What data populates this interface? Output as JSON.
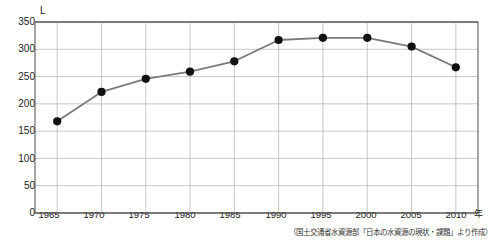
{
  "top_bleed_text": "",
  "axis": {
    "y_unit": "L",
    "x_unit": "年",
    "y_ticks": [
      "0",
      "50",
      "100",
      "150",
      "200",
      "250",
      "300",
      "350"
    ],
    "x_ticks": [
      "1965",
      "1970",
      "1975",
      "1980",
      "1985",
      "1990",
      "1995",
      "2000",
      "2005",
      "2010"
    ]
  },
  "source_note": "（国土交通省水資源部「日本の水資源の現状・課題」より作成）",
  "colors": {
    "line": "#7a7a7a",
    "marker": "#111111",
    "grid": "#b9b9b9",
    "axis": "#555555",
    "background": "#ffffff"
  },
  "chart_data": {
    "type": "line",
    "title": "",
    "xlabel": "年",
    "ylabel": "L",
    "x": [
      1965,
      1970,
      1975,
      1980,
      1985,
      1990,
      1995,
      2000,
      2005,
      2010
    ],
    "categories": [
      "1965",
      "1970",
      "1975",
      "1980",
      "1985",
      "1990",
      "1995",
      "2000",
      "2005",
      "2010"
    ],
    "values": [
      168,
      222,
      246,
      259,
      278,
      317,
      321,
      321,
      305,
      267
    ],
    "series": [
      {
        "name": "1人1日あたり水使用量",
        "values": [
          168,
          222,
          246,
          259,
          278,
          317,
          321,
          321,
          305,
          267
        ]
      }
    ],
    "ylim": [
      0,
      350
    ],
    "xlim": [
      1962.5,
      2012.5
    ],
    "ytick_step": 50,
    "xtick_step": 5,
    "grid": true,
    "legend": "none",
    "markers": "filled-circle"
  }
}
